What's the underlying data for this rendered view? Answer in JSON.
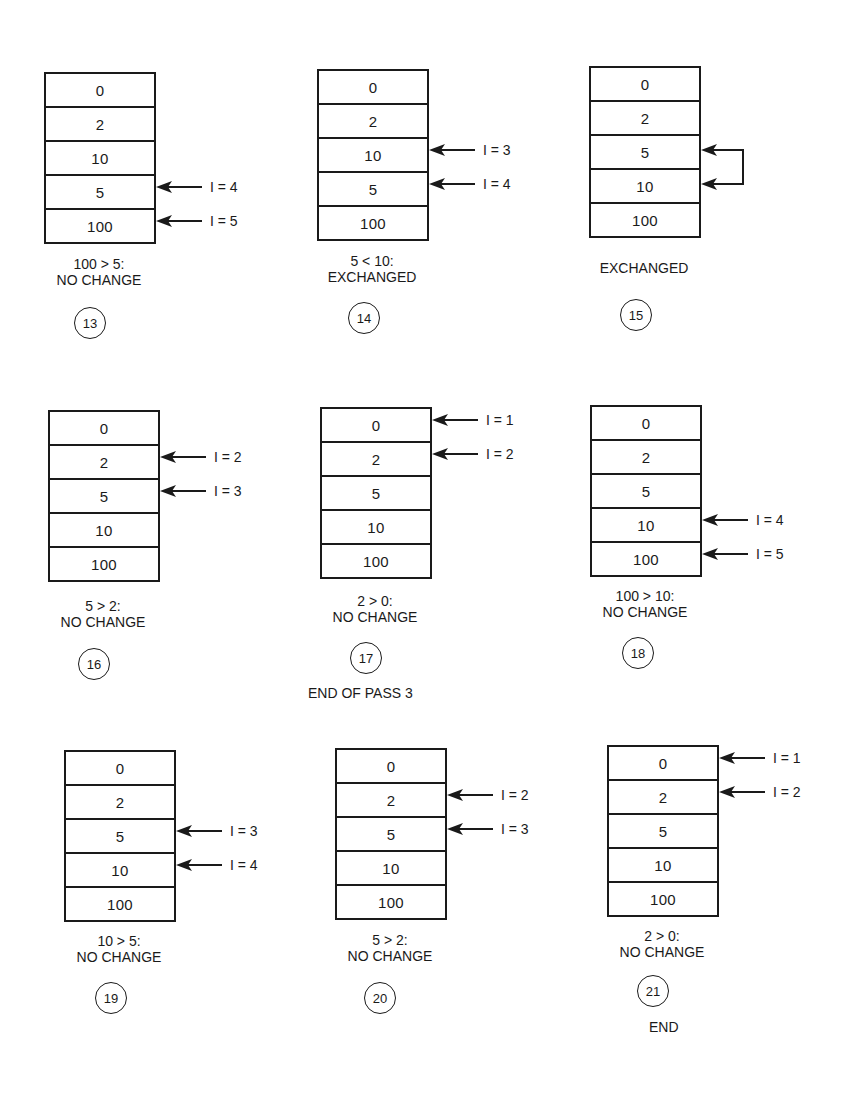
{
  "panels": [
    {
      "step": "13",
      "cells": [
        "0",
        "2",
        "10",
        "5",
        "100"
      ],
      "pointers": [
        {
          "row": 3,
          "label": "I = 4"
        },
        {
          "row": 4,
          "label": "I = 5"
        }
      ],
      "caption_line1": "100 > 5:",
      "caption_line2": "NO CHANGE"
    },
    {
      "step": "14",
      "cells": [
        "0",
        "2",
        "10",
        "5",
        "100"
      ],
      "pointers": [
        {
          "row": 2,
          "label": "I = 3"
        },
        {
          "row": 3,
          "label": "I = 4"
        }
      ],
      "caption_line1": "5 < 10:",
      "caption_line2": "EXCHANGED"
    },
    {
      "step": "15",
      "cells": [
        "0",
        "2",
        "5",
        "10",
        "100"
      ],
      "swap_rows": [
        2,
        3
      ],
      "caption_line1": "",
      "caption_line2": "EXCHANGED"
    },
    {
      "step": "16",
      "cells": [
        "0",
        "2",
        "5",
        "10",
        "100"
      ],
      "pointers": [
        {
          "row": 1,
          "label": "I = 2"
        },
        {
          "row": 2,
          "label": "I = 3"
        }
      ],
      "caption_line1": "5 > 2:",
      "caption_line2": "NO CHANGE"
    },
    {
      "step": "17",
      "cells": [
        "0",
        "2",
        "5",
        "10",
        "100"
      ],
      "pointers": [
        {
          "row": 0,
          "label": "I = 1"
        },
        {
          "row": 1,
          "label": "I = 2"
        }
      ],
      "caption_line1": "2 > 0:",
      "caption_line2": "NO CHANGE",
      "note": "END OF PASS 3"
    },
    {
      "step": "18",
      "cells": [
        "0",
        "2",
        "5",
        "10",
        "100"
      ],
      "pointers": [
        {
          "row": 3,
          "label": "I = 4"
        },
        {
          "row": 4,
          "label": "I = 5"
        }
      ],
      "caption_line1": "100 > 10:",
      "caption_line2": "NO CHANGE"
    },
    {
      "step": "19",
      "cells": [
        "0",
        "2",
        "5",
        "10",
        "100"
      ],
      "pointers": [
        {
          "row": 2,
          "label": "I = 3"
        },
        {
          "row": 3,
          "label": "I = 4"
        }
      ],
      "caption_line1": "10 > 5:",
      "caption_line2": "NO CHANGE"
    },
    {
      "step": "20",
      "cells": [
        "0",
        "2",
        "5",
        "10",
        "100"
      ],
      "pointers": [
        {
          "row": 1,
          "label": "I = 2"
        },
        {
          "row": 2,
          "label": "I = 3"
        }
      ],
      "caption_line1": "5 > 2:",
      "caption_line2": "NO CHANGE"
    },
    {
      "step": "21",
      "cells": [
        "0",
        "2",
        "5",
        "10",
        "100"
      ],
      "pointers": [
        {
          "row": 0,
          "label": "I = 1"
        },
        {
          "row": 1,
          "label": "I = 2"
        }
      ],
      "caption_line1": "2 > 0:",
      "caption_line2": "NO CHANGE",
      "note": "END"
    }
  ],
  "colors": {
    "ink": "#1a1a1a",
    "paper": "#ffffff"
  }
}
